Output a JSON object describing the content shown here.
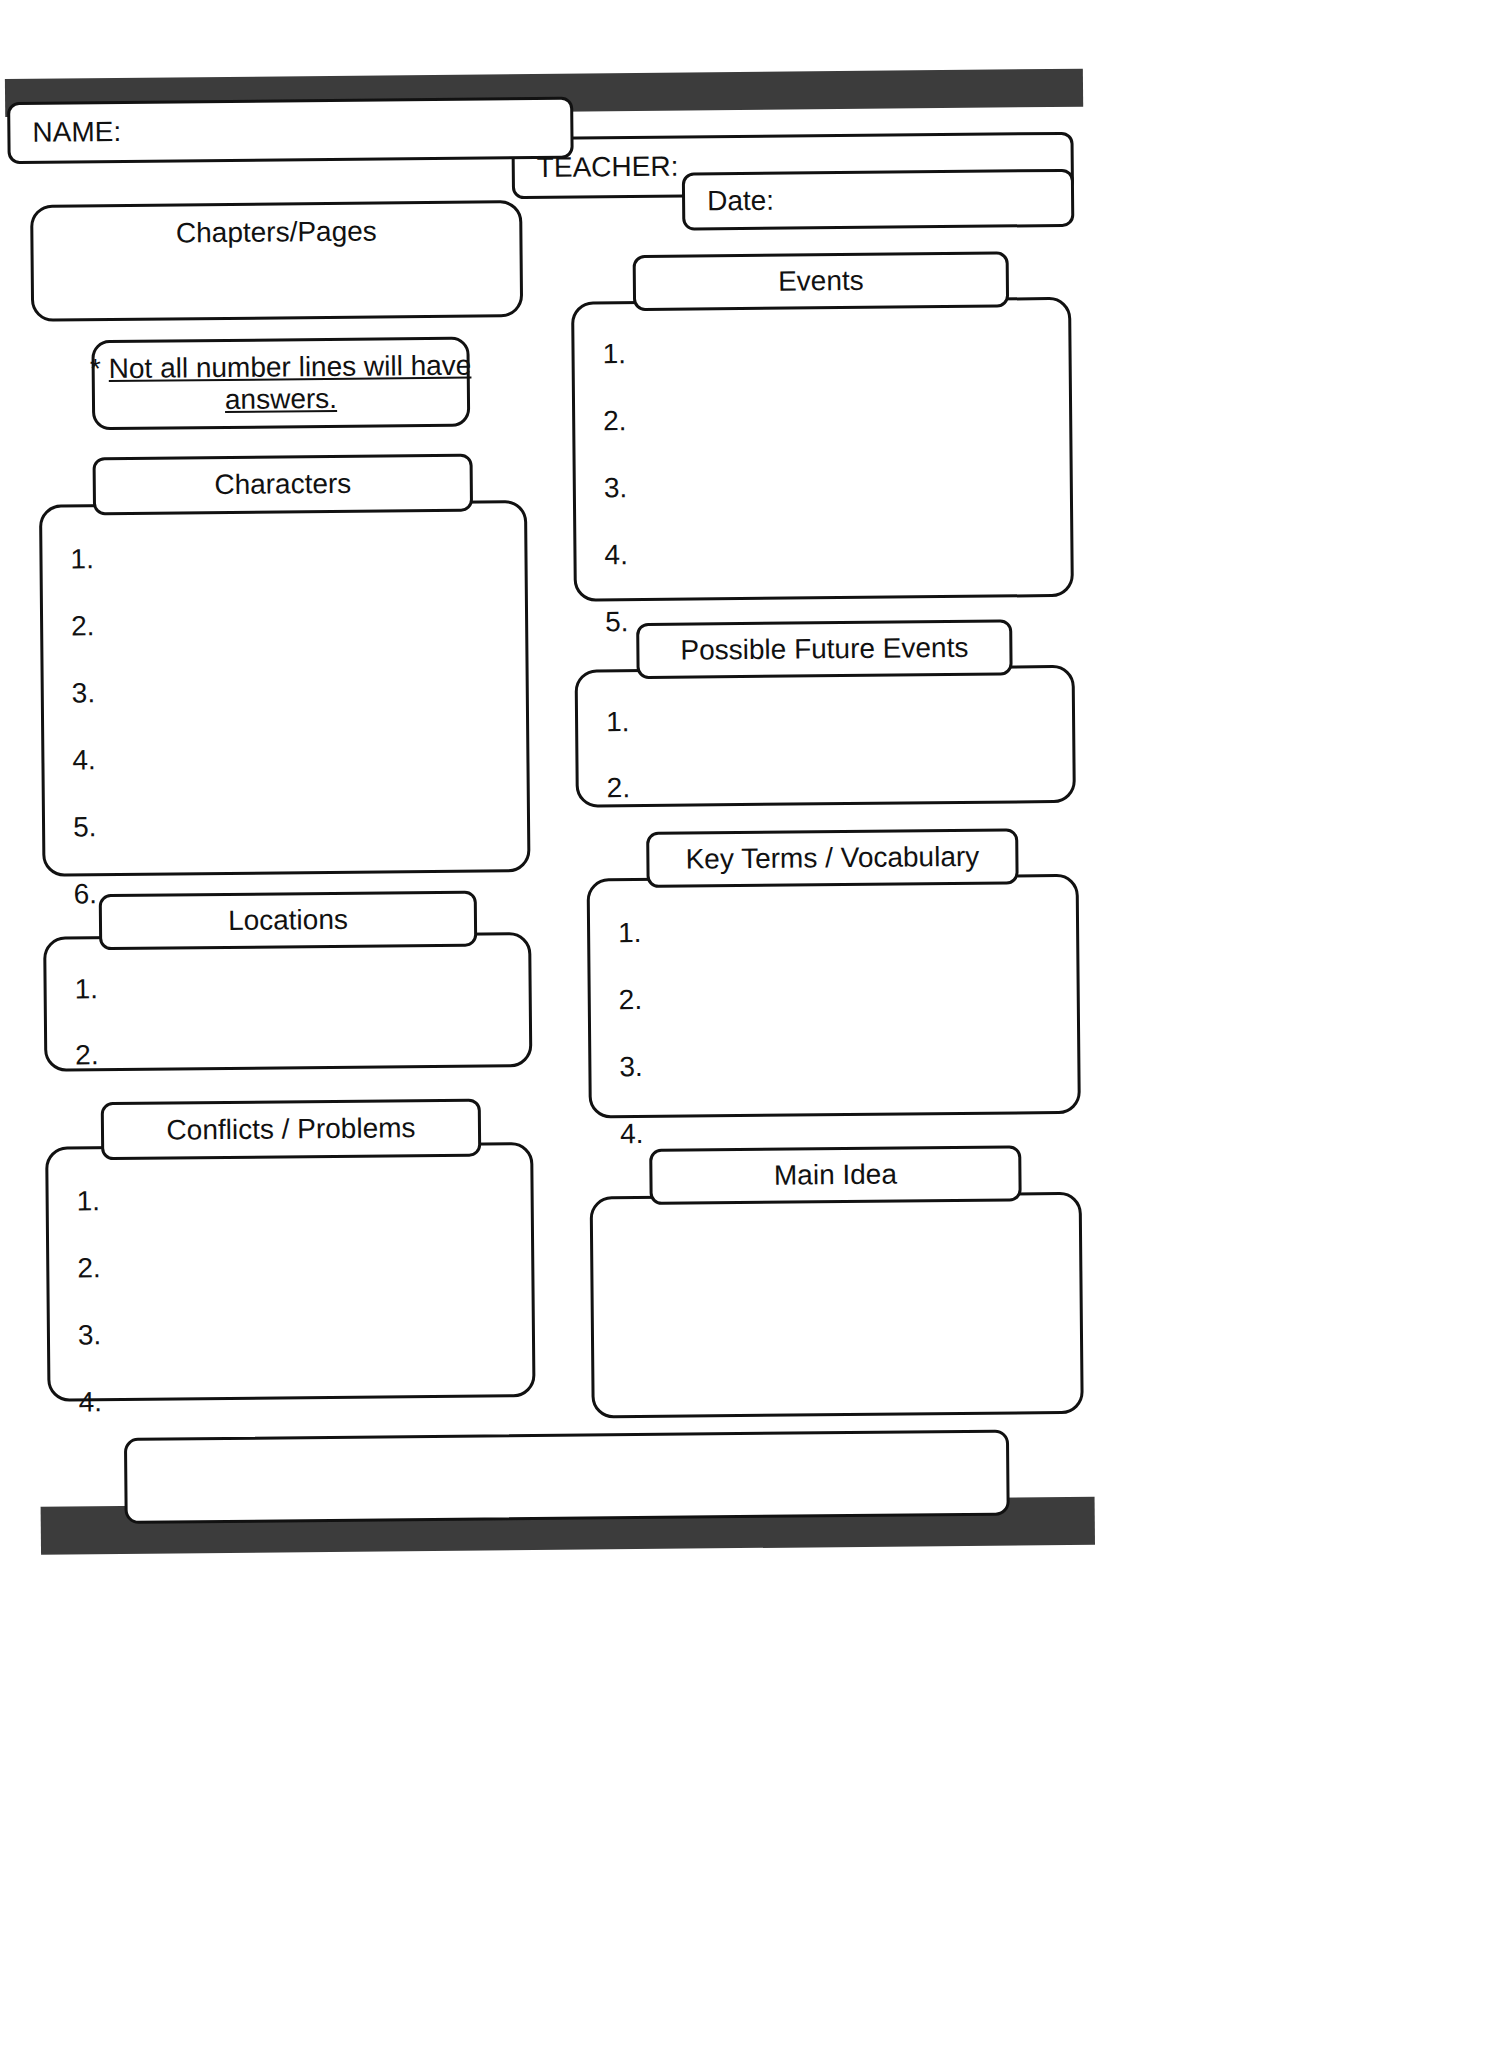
{
  "page": {
    "type": "reading-graphic-organizer-worksheet",
    "ink_color": "#111111",
    "bar_color": "#3c3c3c",
    "paper_color": "#ffffff"
  },
  "header": {
    "name_label": "NAME:",
    "teacher_label": "TEACHER:",
    "date_label": "Date:"
  },
  "sections": {
    "chapters": {
      "title": "Chapters/Pages",
      "items": []
    },
    "note": {
      "star": "*",
      "line1": "Not all number lines will have",
      "line2": "answers."
    },
    "characters": {
      "title": "Characters",
      "items": [
        "1.",
        "2.",
        "3.",
        "4.",
        "5.",
        "6."
      ]
    },
    "locations": {
      "title": "Locations",
      "items": [
        "1.",
        "2."
      ]
    },
    "conflicts": {
      "title": "Conflicts / Problems",
      "items": [
        "1.",
        "2.",
        "3.",
        "4."
      ]
    },
    "events": {
      "title": "Events",
      "items": [
        "1.",
        "2.",
        "3.",
        "4.",
        "5."
      ]
    },
    "future_events": {
      "title": "Possible Future Events",
      "items": [
        "1.",
        "2."
      ]
    },
    "key_terms": {
      "title": "Key Terms / Vocabulary",
      "items": [
        "1.",
        "2.",
        "3.",
        "4."
      ]
    },
    "main_idea": {
      "title": "Main Idea",
      "items": []
    },
    "footer_box": {
      "title": "",
      "items": []
    }
  }
}
